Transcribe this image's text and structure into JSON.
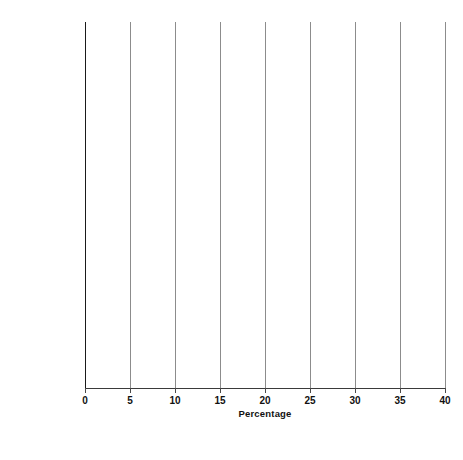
{
  "chart_data": {
    "type": "bar",
    "orientation": "horizontal",
    "title": "",
    "xlabel": "Percentage",
    "ylabel": "",
    "xlim": [
      0,
      40
    ],
    "xticks": [
      "0",
      "5",
      "10",
      "15",
      "20",
      "25",
      "30",
      "35",
      "40"
    ],
    "grid": true,
    "legend_position": "bottom",
    "categories": [
      "Heroin",
      "Hallucinogens",
      "Cocaine",
      "Marijuana",
      "Any Illicit Drug"
    ],
    "series": [
      {
        "name": "Lifetime",
        "values": [
          1.1,
          8.7,
          11.3,
          33.7,
          37.2
        ]
      },
      {
        "name": "Past Year",
        "values": [
          0.1,
          1.2,
          2.2,
          9.0,
          11.8
        ]
      },
      {
        "name": "Past Month",
        "values": [
          0.0,
          0.2,
          0.6,
          4.3,
          5.6
        ]
      }
    ],
    "bar_order_top_to_bottom": [
      "Past Month",
      "Past Year",
      "Lifetime"
    ],
    "data_labels": {
      "Heroin": [
        "0.0",
        "0.1",
        "1.1"
      ],
      "Hallucinogens": [
        "0.2",
        "1.2",
        "8.7"
      ],
      "Cocaine": [
        "0.6",
        "2.2",
        "11.3"
      ],
      "Marijuana": [
        "4.3",
        "9.0",
        "33.7"
      ],
      "Any Illicit Drug": [
        "5.6",
        "11.8",
        "37.2"
      ]
    },
    "colors": {
      "bar": "#141414",
      "gridline": "#8c8c8c",
      "axis": "#1a1a1a",
      "text": "#111111",
      "background": "#ffffff"
    }
  },
  "axis": {
    "x_title": "Percentage",
    "ticks": [
      "0",
      "5",
      "10",
      "15",
      "20",
      "25",
      "30",
      "35",
      "40"
    ]
  },
  "legend": {
    "items": [
      {
        "label": "Lifetime"
      },
      {
        "label": "Past Year"
      },
      {
        "label": "Past Month"
      }
    ]
  },
  "categories": [
    {
      "label": "Heroin"
    },
    {
      "label": "Hallucinogens"
    },
    {
      "label": "Cocaine"
    },
    {
      "label": "Marijuana"
    },
    {
      "label": "Any Illicit Drug"
    }
  ]
}
